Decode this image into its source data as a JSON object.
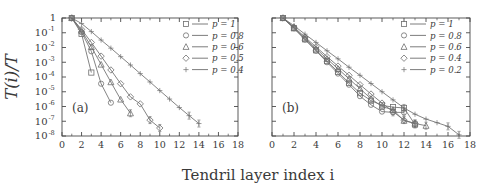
{
  "figure": {
    "xlabel": "Tendril layer index i",
    "ylabel": "T(i)/T",
    "ylabel_parts": {
      "t": "T",
      "i": "i",
      "slash": ")/",
      "t2": "T",
      "open": "("
    },
    "panel_a_label": "(a)",
    "panel_b_label": "(b)",
    "colors": {
      "axis": "#4a4a4a",
      "text": "#3a3a3a",
      "curve": "#6e6e6e",
      "marker": "#6e6e6e",
      "background": "#ffffff"
    }
  },
  "axes": {
    "x_ticks": [
      0,
      2,
      4,
      6,
      8,
      10,
      12,
      14,
      16,
      18
    ],
    "x_tick_labels": [
      "0",
      "2",
      "4",
      "6",
      "8",
      "10",
      "12",
      "14",
      "16",
      "18"
    ],
    "x_minor_step": 1,
    "xlim": [
      0,
      18
    ],
    "y_tick_labels": [
      "1",
      "10^-1",
      "10^-2",
      "10^-3",
      "10^-4",
      "10^-5",
      "10^-6",
      "10^-7",
      "10^-8"
    ],
    "y_tick_exponents": [
      "",
      "-1",
      "-2",
      "-3",
      "-4",
      "-5",
      "-6",
      "-7",
      "-8"
    ],
    "y_tick_mantissas": [
      "1",
      "10",
      "10",
      "10",
      "10",
      "10",
      "10",
      "10",
      "10"
    ],
    "ylim_exp": [
      0,
      -8
    ],
    "y_log": true,
    "grid": false
  },
  "chart_data": [
    {
      "type": "line",
      "panel": "(a)",
      "title": "",
      "xlabel": "Tendril layer index i",
      "ylabel": "T(i)/T",
      "xlim": [
        0,
        18
      ],
      "ylim": [
        1e-08,
        1
      ],
      "yscale": "log",
      "legend_position": "top-right",
      "series": [
        {
          "name": "p = 1",
          "marker": "square",
          "x": [
            1,
            2,
            3
          ],
          "y": [
            1.0,
            0.085,
            0.0002
          ]
        },
        {
          "name": "p = 0.8",
          "marker": "circle",
          "x": [
            1,
            2,
            3,
            4,
            5
          ],
          "y": [
            1.0,
            0.11,
            0.0055,
            3.5e-05,
            1.8e-06
          ]
        },
        {
          "name": "p = 0.6",
          "marker": "triangle",
          "x": [
            1,
            2,
            3,
            4,
            5,
            6,
            7
          ],
          "y": [
            1.0,
            0.14,
            0.011,
            0.0007,
            4.5e-05,
            3e-06,
            3.5e-07
          ]
        },
        {
          "name": "p = 0.5",
          "marker": "diamond",
          "x": [
            1,
            2,
            3,
            4,
            5,
            6,
            7,
            8,
            9,
            10
          ],
          "y": [
            1.0,
            0.17,
            0.022,
            0.0026,
            0.0003,
            3.5e-05,
            4.5e-06,
            1.5e-06,
            1.2e-07,
            3.5e-08
          ]
        },
        {
          "name": "p = 0.4",
          "marker": "plus",
          "x": [
            1,
            2,
            3,
            4,
            5,
            6,
            7,
            8,
            9,
            10,
            11,
            12,
            13,
            14
          ],
          "y": [
            1.0,
            0.42,
            0.12,
            0.032,
            0.009,
            0.0024,
            0.00065,
            0.00017,
            4.6e-05,
            1.2e-05,
            3.2e-06,
            8.5e-07,
            2.4e-07,
            7e-08
          ]
        }
      ]
    },
    {
      "type": "line",
      "panel": "(b)",
      "title": "",
      "xlabel": "Tendril layer index i",
      "ylabel": "T(i)/T",
      "xlim": [
        0,
        18
      ],
      "ylim": [
        1e-08,
        1
      ],
      "yscale": "log",
      "legend_position": "top-right",
      "series": [
        {
          "name": "p = 1",
          "marker": "square",
          "x": [
            1,
            2,
            3,
            4,
            5,
            6,
            7,
            8,
            9,
            10,
            11,
            12,
            13
          ],
          "y": [
            1.0,
            0.2,
            0.036,
            0.0065,
            0.0012,
            0.00022,
            4e-05,
            8e-06,
            2.5e-06,
            1.2e-06,
            9e-07,
            8e-07,
            6e-08
          ]
        },
        {
          "name": "p = 0.8",
          "marker": "circle",
          "x": [
            1,
            2,
            3,
            4,
            5,
            6,
            7,
            8,
            9,
            10,
            11,
            12
          ],
          "y": [
            1.0,
            0.2,
            0.034,
            0.006,
            0.001,
            0.00017,
            3e-05,
            5e-06,
            1.3e-06,
            4.5e-07,
            4e-07,
            4e-07
          ]
        },
        {
          "name": "p = 0.6",
          "marker": "triangle",
          "x": [
            1,
            2,
            3,
            4,
            5,
            6,
            7,
            8,
            9,
            10,
            11,
            12,
            13,
            14
          ],
          "y": [
            1.0,
            0.22,
            0.042,
            0.0085,
            0.0017,
            0.00036,
            7.5e-05,
            1.6e-05,
            3.4e-06,
            1e-06,
            6e-07,
            1.1e-07,
            7e-08,
            5e-08
          ]
        },
        {
          "name": "p = 0.4",
          "marker": "diamond",
          "x": [
            1,
            2,
            3,
            4,
            5,
            6,
            7,
            8,
            9,
            10,
            11,
            12,
            13
          ],
          "y": [
            1.0,
            0.24,
            0.05,
            0.011,
            0.0024,
            0.00055,
            0.00013,
            3e-05,
            7e-06,
            1.7e-06,
            4.5e-07,
            1.2e-07,
            7e-08
          ]
        },
        {
          "name": "p = 0.2",
          "marker": "plus",
          "x": [
            1,
            2,
            3,
            4,
            5,
            6,
            7,
            8,
            9,
            10,
            11,
            12,
            13,
            14,
            15,
            16,
            17
          ],
          "y": [
            1.0,
            0.3,
            0.08,
            0.022,
            0.006,
            0.0017,
            0.00046,
            0.00013,
            3.6e-05,
            1e-05,
            2.8e-06,
            8e-07,
            3e-07,
            1.4e-07,
            8e-08,
            4.5e-08,
            1.2e-08
          ]
        }
      ]
    }
  ],
  "legends": {
    "panel_a": [
      {
        "label": "p = 1",
        "marker": "square"
      },
      {
        "label": "p = 0.8",
        "marker": "circle"
      },
      {
        "label": "p = 0.6",
        "marker": "triangle"
      },
      {
        "label": "p = 0.5",
        "marker": "diamond"
      },
      {
        "label": "p = 0.4",
        "marker": "plus"
      }
    ],
    "panel_b": [
      {
        "label": "p = 1",
        "marker": "square"
      },
      {
        "label": "p = 0.8",
        "marker": "circle"
      },
      {
        "label": "p = 0.6",
        "marker": "triangle"
      },
      {
        "label": "p = 0.4",
        "marker": "diamond"
      },
      {
        "label": "p = 0.2",
        "marker": "plus"
      }
    ]
  }
}
